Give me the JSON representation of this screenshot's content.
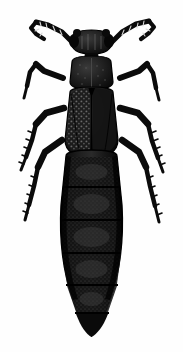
{
  "figure": {
    "domain": "Natural-Image",
    "subject": "rove beetle",
    "family": "Staphylinidae",
    "view": "dorsal",
    "style": "black and white scientific line illustration",
    "caption": "",
    "width_px": 183,
    "height_px": 352
  },
  "colors": {
    "background": "#fefefe",
    "body_black": "#0d0d0d",
    "body_dark": "#151515",
    "body_mid": "#232323",
    "body_highlight": "#3a3a3a",
    "outline": "#000000",
    "punctation": "#5a5a5a"
  },
  "anatomy": {
    "antenna_left": {
      "label": "left antenna",
      "segments": 11,
      "shape": "elbowed, directed anterolaterally"
    },
    "antenna_right": {
      "label": "right antenna",
      "segments": 11,
      "shape": "elbowed, directed anterolaterally"
    },
    "head": {
      "label": "head",
      "shape": "transverse, rounded sides, paired eyes",
      "width_px": 42,
      "height_px": 20
    },
    "neck": {
      "label": "neck",
      "shape": "narrow constriction"
    },
    "pronotum": {
      "label": "pronotum",
      "shape": "subquadrate, slightly narrowed posteriorly",
      "width_px": 40,
      "height_px": 28
    },
    "elytra": {
      "label": "elytra",
      "shape": "broad, punctate, divided by median suture",
      "texture": "dense punctation",
      "width_px": 70,
      "height_px": 72
    },
    "abdomen": {
      "label": "abdomen",
      "shape": "elongate, parallel-sided then tapering to a point",
      "segments": 6,
      "width_px": 68,
      "height_px": 170
    },
    "legs": {
      "label": "legs",
      "count": 6,
      "pairs": [
        {
          "name": "foreleg-pair",
          "position": "anterior"
        },
        {
          "name": "midleg-pair",
          "position": "median"
        },
        {
          "name": "hindleg-pair",
          "position": "posterior"
        }
      ],
      "tibia_texture": "spinose"
    }
  },
  "labels": {
    "alt_text": "Dorsal view black ink illustration of a rove beetle with elbowed antennae, punctate elytra, six spiny legs and a long tapering segmented abdomen."
  }
}
